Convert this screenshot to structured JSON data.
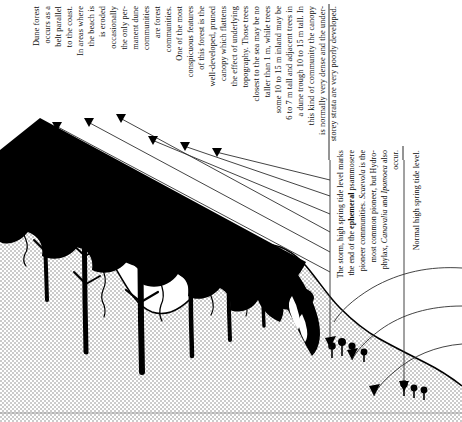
{
  "figure": {
    "bottom_rule": "hairline"
  },
  "annotation_block_main": {
    "name": "dune-forest-description",
    "lines": [
      "Dune forest",
      "occurs as a",
      "belt parallel",
      "to the coast.",
      "In areas where",
      "the beach is",
      "is eroded",
      "occasionally",
      "the only per-",
      "manent dune",
      "communities",
      "are forest",
      "communities.",
      "One of the most",
      "conspicuous features",
      "of this forest is the",
      "well-developed, pruned",
      "canopy which flattens",
      "the effect of underlying",
      "topography. Those trees",
      "closest to the sea may be no",
      "taller than 1 m, while trees",
      "some 10 to 15 m inland may be",
      "6 to 7 m tall and adjacent trees in",
      "a dune trough 10 to 15 m tall. In",
      "this kind of community the canopy",
      "is normally very dense and the under-",
      "storey strata are very poorly developed."
    ]
  },
  "annotation_block_storm": {
    "name": "storm-tide-description",
    "lines": [
      "The storm, high spring tide level marks",
      "the end of the ephemeral psammosere",
      "pioneer communities. Scaevola is the",
      "most common pioneer, but Hydro-",
      "phylax, Canavalia and Ipomoea also",
      "occur."
    ],
    "bold_terms": [
      "ephemeral"
    ],
    "italic_terms": [
      "Scaevola",
      "Hydrophylax",
      "Canavalia",
      "Ipomoea"
    ]
  },
  "annotation_block_tide": {
    "name": "normal-tide-label",
    "lines": [
      "Normal high spring tide level."
    ]
  },
  "scene": {
    "canopy_label": "forest-canopy-silhouette",
    "dune_label": "stippled-dune-sand",
    "trees_label": "tree-trunks",
    "pioneers_label": "pioneer-plants",
    "leader_count": 9,
    "curved_arrow_count": 5
  },
  "colors": {
    "ink": "#000000",
    "paper": "#ffffff",
    "stipple": "#8d8d8d",
    "rule": "#9b9b9b",
    "leader": "#3a3a3a"
  }
}
